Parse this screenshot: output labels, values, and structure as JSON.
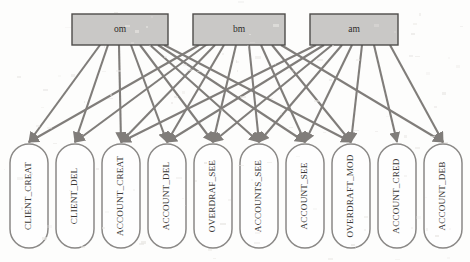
{
  "diagram": {
    "type": "bipartite-graph",
    "background_color": "#fdfdfc",
    "edge_color": "#807d7a",
    "role_fill_color": "#c9c8c6",
    "role_border_color": "#4e4c4a",
    "permission_fill_color": "#fefefe",
    "permission_border_color": "#8a8886"
  },
  "roles": [
    {
      "id": "om",
      "label": "om",
      "x": 72,
      "y": 14,
      "w": 96,
      "h": 31
    },
    {
      "id": "bm",
      "label": "bm",
      "x": 193,
      "y": 14,
      "w": 92,
      "h": 31
    },
    {
      "id": "am",
      "label": "am",
      "x": 310,
      "y": 14,
      "w": 88,
      "h": 31
    }
  ],
  "permissions": [
    {
      "id": "CLIENT_CREAT",
      "label": "CLIENT_CREAT",
      "x": 10,
      "y": 144,
      "w": 38,
      "h": 104
    },
    {
      "id": "CLIENT_DEL",
      "label": "CLIENT_DEL",
      "x": 56,
      "y": 144,
      "w": 38,
      "h": 104
    },
    {
      "id": "ACCOUNT_CREAT",
      "label": "ACCOUNT_CREAT",
      "x": 102,
      "y": 144,
      "w": 38,
      "h": 104
    },
    {
      "id": "ACCOUNT_DEL",
      "label": "ACCOUNT_DEL",
      "x": 148,
      "y": 144,
      "w": 38,
      "h": 104
    },
    {
      "id": "OVERDRAF_SEE",
      "label": "OVERDRAF_SEE",
      "x": 194,
      "y": 144,
      "w": 38,
      "h": 104
    },
    {
      "id": "ACCOUNTS_SEE",
      "label": "ACCOUNTS_SEE",
      "x": 240,
      "y": 144,
      "w": 38,
      "h": 104
    },
    {
      "id": "ACCOUNT_SEE",
      "label": "ACCOUNT_SEE",
      "x": 286,
      "y": 144,
      "w": 38,
      "h": 104
    },
    {
      "id": "OVERDRAFT_MOD",
      "label": "OVERDRAFT_MOD",
      "x": 332,
      "y": 144,
      "w": 38,
      "h": 104
    },
    {
      "id": "ACCOUNT_CRED",
      "label": "ACCOUNT_CRED",
      "x": 378,
      "y": 144,
      "w": 38,
      "h": 104
    },
    {
      "id": "ACCOUNT_DEB",
      "label": "ACCOUNT_DEB",
      "x": 424,
      "y": 144,
      "w": 38,
      "h": 104
    }
  ],
  "edges": [
    {
      "from": "om",
      "to": "CLIENT_CREAT",
      "fx": 100,
      "arrows": "both"
    },
    {
      "from": "om",
      "to": "CLIENT_DEL",
      "fx": 108,
      "arrows": "both"
    },
    {
      "from": "om",
      "to": "ACCOUNT_CREAT",
      "fx": 119,
      "arrows": "end"
    },
    {
      "from": "om",
      "to": "ACCOUNT_DEL",
      "fx": 131,
      "arrows": "end"
    },
    {
      "from": "om",
      "to": "OVERDRAF_SEE",
      "fx": 140,
      "arrows": "end"
    },
    {
      "from": "om",
      "to": "ACCOUNTS_SEE",
      "fx": 150,
      "arrows": "end"
    },
    {
      "from": "om",
      "to": "ACCOUNT_SEE",
      "fx": 158,
      "arrows": "end"
    },
    {
      "from": "om",
      "to": "OVERDRAFT_MOD",
      "fx": 164,
      "arrows": "end"
    },
    {
      "from": "bm",
      "to": "CLIENT_CREAT",
      "fx": 199,
      "arrows": "both"
    },
    {
      "from": "bm",
      "to": "CLIENT_DEL",
      "fx": 206,
      "arrows": "both"
    },
    {
      "from": "bm",
      "to": "ACCOUNT_CREAT",
      "fx": 215,
      "arrows": "end"
    },
    {
      "from": "bm",
      "to": "ACCOUNT_DEL",
      "fx": 224,
      "arrows": "end"
    },
    {
      "from": "bm",
      "to": "OVERDRAF_SEE",
      "fx": 236,
      "arrows": "end"
    },
    {
      "from": "bm",
      "to": "ACCOUNTS_SEE",
      "fx": 249,
      "arrows": "end"
    },
    {
      "from": "bm",
      "to": "ACCOUNT_SEE",
      "fx": 261,
      "arrows": "end"
    },
    {
      "from": "bm",
      "to": "OVERDRAFT_MOD",
      "fx": 272,
      "arrows": "end"
    },
    {
      "from": "bm",
      "to": "ACCOUNT_DEB",
      "fx": 281,
      "arrows": "end"
    },
    {
      "from": "am",
      "to": "ACCOUNT_CREAT",
      "fx": 316,
      "arrows": "end"
    },
    {
      "from": "am",
      "to": "ACCOUNT_DEL",
      "fx": 324,
      "arrows": "end"
    },
    {
      "from": "am",
      "to": "OVERDRAF_SEE",
      "fx": 332,
      "arrows": "end"
    },
    {
      "from": "am",
      "to": "ACCOUNTS_SEE",
      "fx": 342,
      "arrows": "end"
    },
    {
      "from": "am",
      "to": "ACCOUNT_SEE",
      "fx": 352,
      "arrows": "end"
    },
    {
      "from": "am",
      "to": "OVERDRAFT_MOD",
      "fx": 362,
      "arrows": "end"
    },
    {
      "from": "am",
      "to": "ACCOUNT_CRED",
      "fx": 374,
      "arrows": "end"
    },
    {
      "from": "am",
      "to": "ACCOUNT_DEB",
      "fx": 390,
      "arrows": "end"
    }
  ]
}
